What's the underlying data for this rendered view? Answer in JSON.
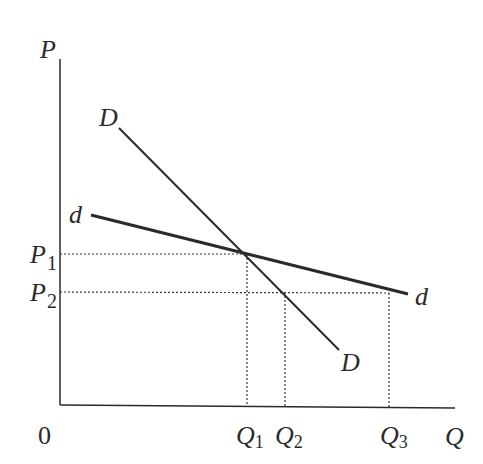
{
  "diagram": {
    "type": "economics-kinked-demand",
    "axes": {
      "y_label": "P",
      "x_label": "Q",
      "origin_label": "0"
    },
    "curves": [
      {
        "name": "D",
        "label_start": "D",
        "label_end": "D",
        "style": "solid-thin"
      },
      {
        "name": "d",
        "label_start": "d",
        "label_end": "d",
        "style": "solid-thick"
      }
    ],
    "price_levels": [
      {
        "label": "P",
        "subscript": "1"
      },
      {
        "label": "P",
        "subscript": "2"
      }
    ],
    "quantity_levels": [
      {
        "label": "Q",
        "subscript": "1"
      },
      {
        "label": "Q",
        "subscript": "2"
      },
      {
        "label": "Q",
        "subscript": "3"
      }
    ],
    "colors": {
      "line": "#2a2a2a",
      "background": "#ffffff"
    }
  }
}
